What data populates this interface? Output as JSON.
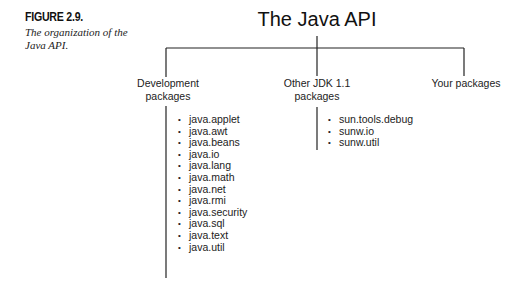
{
  "caption": {
    "label": "FIGURE 2.9.",
    "description_line1": "The organization of the",
    "description_line2": "Java API."
  },
  "diagram": {
    "root": "The Java API",
    "branches": [
      {
        "label_line1": "Development",
        "label_line2": "packages",
        "items": [
          "java.applet",
          "java.awt",
          "java.beans",
          "java.io",
          "java.lang",
          "java.math",
          "java.net",
          "java.rmi",
          "java.security",
          "java.sql",
          "java.text",
          "java.util"
        ]
      },
      {
        "label_line1": "Other JDK 1.1",
        "label_line2": "packages",
        "items": [
          "sun.tools.debug",
          "sunw.io",
          "sunw.util"
        ]
      },
      {
        "label_line1": "Your packages",
        "label_line2": "",
        "items": []
      }
    ],
    "bullet_glyph": "•"
  }
}
